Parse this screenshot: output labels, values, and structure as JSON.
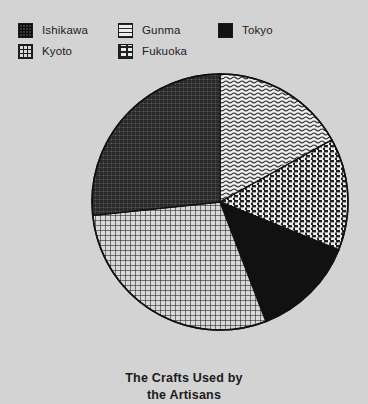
{
  "legend": {
    "rows": [
      [
        {
          "label": "Ishikawa",
          "pattern": "dense-crosshatch",
          "swatch_name": "legend-swatch-ishikawa"
        },
        {
          "label": "Gunma",
          "pattern": "wavy-lines",
          "swatch_name": "legend-swatch-gunma"
        },
        {
          "label": "Tokyo",
          "pattern": "solid-black",
          "swatch_name": "legend-swatch-tokyo"
        }
      ],
      [
        {
          "label": "Kyoto",
          "pattern": "grid",
          "swatch_name": "legend-swatch-kyoto"
        },
        {
          "label": "Fukuoka",
          "pattern": "dotted-brick",
          "swatch_name": "legend-swatch-fukuoka"
        }
      ]
    ]
  },
  "title": {
    "line1": "The Crafts Used by",
    "line2": "the Artisans"
  },
  "colors": {
    "background": "#d3d3d3",
    "outline": "#111111",
    "tokyo_fill": "#111111",
    "text": "#1b1b1b"
  },
  "chart_data": {
    "type": "pie",
    "title": "The Crafts Used by the Artisans",
    "legend_position": "top",
    "start_angle_deg": 0,
    "direction": "clockwise",
    "center": {
      "x": 220,
      "y": 202
    },
    "radius": 128,
    "categories": [
      "Gunma",
      "Fukuoka",
      "Tokyo",
      "Kyoto",
      "Ishikawa"
    ],
    "values": [
      17,
      14,
      13,
      29,
      27
    ],
    "slices": [
      {
        "label": "Gunma",
        "value": 17,
        "start_deg": 0,
        "end_deg": 61,
        "pattern": "wavy-lines",
        "fill": "#ededed"
      },
      {
        "label": "Fukuoka",
        "value": 14,
        "start_deg": 61,
        "end_deg": 112,
        "pattern": "dotted-brick",
        "fill": "#ebebeb"
      },
      {
        "label": "Tokyo",
        "value": 13,
        "start_deg": 112,
        "end_deg": 159,
        "pattern": "solid-black",
        "fill": "#111111"
      },
      {
        "label": "Kyoto",
        "value": 29,
        "start_deg": 159,
        "end_deg": 264,
        "pattern": "grid",
        "fill": "#d8d8d8"
      },
      {
        "label": "Ishikawa",
        "value": 27,
        "start_deg": 264,
        "end_deg": 360,
        "pattern": "dense-crosshatch",
        "fill": "#6a6a6a"
      }
    ]
  }
}
